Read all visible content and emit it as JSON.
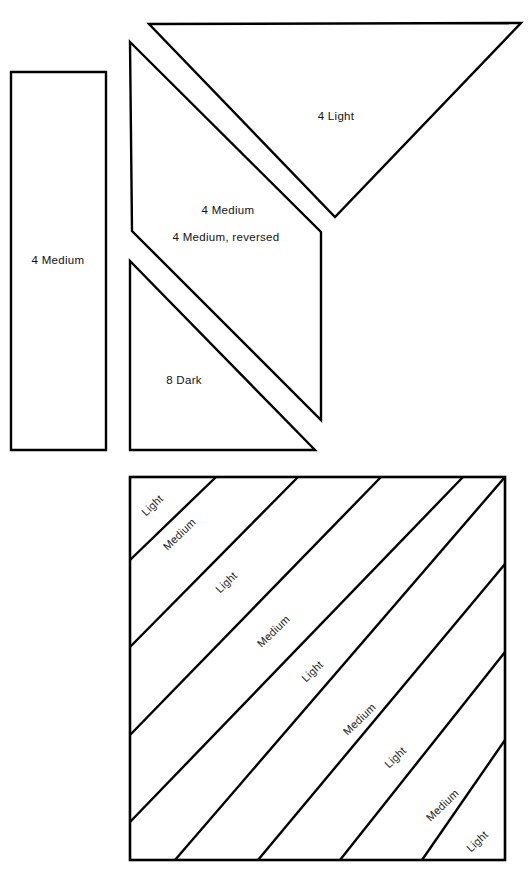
{
  "figure": {
    "background_color": "#ffffff",
    "line_color": "#000000",
    "text_color": "#111111"
  },
  "pattern_pieces": {
    "strip_rectangle": {
      "label": "4 Medium",
      "label_x": 58,
      "label_y": 261,
      "points": "11,72 106,72 106,450 11,450"
    },
    "large_triangle": {
      "label": "4 Light",
      "label_x": 336,
      "label_y": 117,
      "points": "149,24 521,23 335,217"
    },
    "parallelogram": {
      "label_primary": "4  Medium",
      "label_primary_x": 228,
      "label_primary_y": 211,
      "label_secondary": "4  Medium,  reversed",
      "label_secondary_x": 226,
      "label_secondary_y": 238,
      "points": "130,42 321,232 321,420 132,231"
    },
    "dark_triangle": {
      "label": "8 Dark",
      "label_x": 184,
      "label_y": 381,
      "points": "130,261 315,450 130,450"
    }
  },
  "striped_block": {
    "frame": {
      "x": 130,
      "y": 477,
      "width": 375,
      "height": 383
    },
    "stripe_lines": [
      "130,560 216,477",
      "130,647 298,477",
      "130,735 381,477",
      "130,822 463,477",
      "175,860 505,477",
      "258,860 505,564",
      "340,860 505,652",
      "422,860 505,740"
    ],
    "stripe_labels": [
      {
        "text": "Light",
        "x": 153,
        "y": 506,
        "rotate": -44
      },
      {
        "text": "Medium",
        "x": 180,
        "y": 535,
        "rotate": -44
      },
      {
        "text": "Light",
        "x": 227,
        "y": 583,
        "rotate": -44
      },
      {
        "text": "Medium",
        "x": 274,
        "y": 632,
        "rotate": -44
      },
      {
        "text": "Light",
        "x": 313,
        "y": 672,
        "rotate": -44
      },
      {
        "text": "Medium",
        "x": 360,
        "y": 720,
        "rotate": -44
      },
      {
        "text": "Light",
        "x": 396,
        "y": 758,
        "rotate": -44
      },
      {
        "text": "Medium",
        "x": 443,
        "y": 806,
        "rotate": -44
      },
      {
        "text": "Light",
        "x": 478,
        "y": 842,
        "rotate": -44
      }
    ]
  }
}
